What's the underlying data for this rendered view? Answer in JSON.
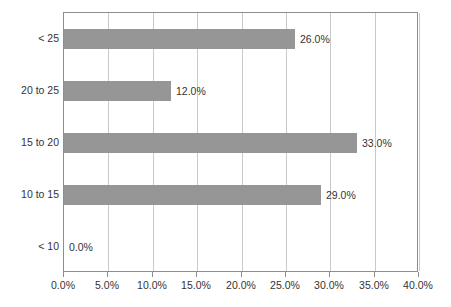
{
  "chart_data": {
    "type": "bar",
    "orientation": "horizontal",
    "title": "",
    "subtitle": "",
    "xlabel": "",
    "ylabel": "",
    "categories": [
      "< 10",
      "10 to 15",
      "15 to 20",
      "20 to 25",
      "< 25"
    ],
    "values": [
      0.0,
      29.0,
      33.0,
      12.0,
      26.0
    ],
    "value_labels": [
      "0.0%",
      "29.0%",
      "33.0%",
      "12.0%",
      "26.0%"
    ],
    "xlim": [
      0,
      40
    ],
    "xticks": [
      0,
      5,
      10,
      15,
      20,
      25,
      30,
      35,
      40
    ],
    "xtick_labels": [
      "0.0%",
      "5.0%",
      "10.0%",
      "15.0%",
      "20.0%",
      "25.0%",
      "30.0%",
      "35.0%",
      "40.0%"
    ],
    "grid": {
      "vertical": true,
      "horizontal": false
    },
    "legend": null,
    "series": [
      {
        "name": "",
        "values": [
          0.0,
          29.0,
          33.0,
          12.0,
          26.0
        ]
      }
    ],
    "colors": {
      "bar_fill": "#969696",
      "gridline": "#c9c9c9",
      "axis": "#8d8d8d",
      "text": "#333333",
      "background": "#ffffff"
    }
  }
}
